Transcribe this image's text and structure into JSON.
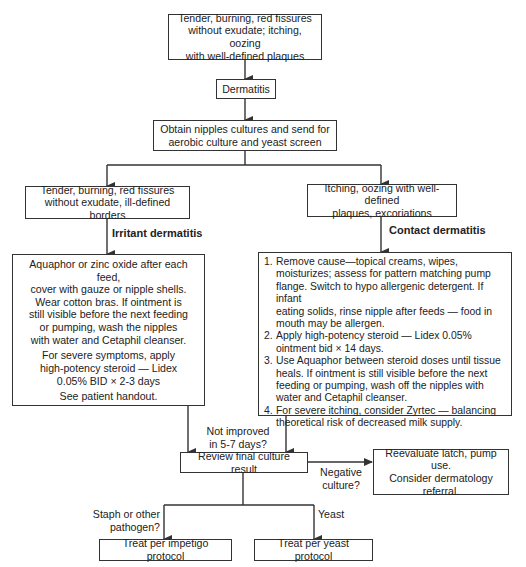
{
  "nodes": {
    "start": {
      "lines": [
        "Tender, burning, red fissures",
        "without exudate; itching, oozing",
        "with well-defined plaques"
      ]
    },
    "dermatitis": {
      "label": "Dermatitis"
    },
    "cultures": {
      "lines": [
        "Obtain nipples cultures and send for",
        "aerobic culture and yeast screen"
      ]
    },
    "irritant_presentation": {
      "lines": [
        "Tender, burning, red fissures",
        "without exudate, ill-defined borders"
      ]
    },
    "contact_presentation": {
      "lines": [
        "Itching, oozing with well-defined",
        "plaques, excoriations"
      ]
    },
    "irritant_treatment": {
      "para1": [
        "Aquaphor or zinc oxide after each feed,",
        "cover with gauze or nipple shells.",
        "Wear cotton bras. If ointment is",
        "still visible before the next feeding",
        "or pumping, wash the nipples",
        "with water and Cetaphil cleanser."
      ],
      "para2": [
        "For severe symptoms, apply",
        "high-potency steroid — Lidex",
        "0.05% BID × 2-3 days"
      ],
      "para3": [
        "See patient handout."
      ]
    },
    "contact_treatment": {
      "items": [
        {
          "num": "1.",
          "lines": [
            "Remove cause—topical creams, wipes,",
            "moisturizes; assess for pattern matching pump",
            "flange. Switch to hypo allergenic detergent. If infant",
            "eating solids, rinse nipple after feeds — food in",
            "mouth may be allergen."
          ]
        },
        {
          "num": "2.",
          "lines": [
            "Apply high-potency steroid — Lidex 0.05%",
            "ointment bid × 14 days."
          ]
        },
        {
          "num": "3.",
          "lines": [
            "Use Aquaphor between steroid doses until tissue",
            "heals. If ointment is still visible before the next",
            "feeding or pumping, wash off the nipples with",
            "water and Cetaphil cleanser."
          ]
        },
        {
          "num": "4.",
          "lines": [
            "For severe itching, consider Zyrtec — balancing",
            "theoretical risk of decreased milk supply."
          ]
        }
      ]
    },
    "review": {
      "label": "Review final culture result"
    },
    "reevaluate": {
      "lines": [
        "Reevaluate latch, pump use.",
        "Consider dermatology",
        "referral."
      ]
    },
    "impetigo": {
      "label": "Treat per impetigo protocol"
    },
    "yeast": {
      "label": "Treat per yeast protocol"
    }
  },
  "edge_labels": {
    "irritant": "Irritant dermatitis",
    "contact": "Contact dermatitis",
    "not_improved": [
      "Not improved",
      "in 5-7 days?"
    ],
    "negative": [
      "Negative",
      "culture?"
    ],
    "staph": [
      "Staph or other",
      "pathogen?"
    ],
    "yeast": "Yeast"
  },
  "colors": {
    "line": "#333333",
    "text": "#222222",
    "background": "#ffffff"
  }
}
